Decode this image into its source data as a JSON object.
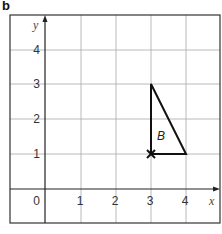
{
  "part_label": "b",
  "axes": {
    "x_label": "x",
    "y_label": "y",
    "x_ticks": [
      "0",
      "1",
      "2",
      "3",
      "4"
    ],
    "y_ticks": [
      "1",
      "2",
      "3",
      "4"
    ],
    "x_range": [
      -1,
      5
    ],
    "y_range": [
      -1,
      5
    ]
  },
  "shape": {
    "label": "B",
    "vertices": [
      [
        3,
        1
      ],
      [
        3,
        3
      ],
      [
        4,
        1
      ]
    ],
    "marker": {
      "point": [
        3,
        1
      ],
      "symbol": "×"
    }
  },
  "colors": {
    "grid": "#a0a0a0",
    "axis": "#222222",
    "shape": "#111111"
  }
}
